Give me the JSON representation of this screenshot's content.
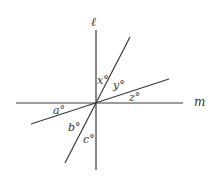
{
  "diagram": {
    "lines": [
      {
        "id": "l",
        "name": "ℓ",
        "orientation": "vertical"
      },
      {
        "id": "m",
        "name": "m",
        "orientation": "horizontal"
      },
      {
        "id": "steep",
        "name": "",
        "orientation": "steep-diagonal"
      },
      {
        "id": "shallow",
        "name": "",
        "orientation": "shallow-diagonal"
      }
    ],
    "angle_labels": {
      "x": "x°",
      "y": "y°",
      "z": "z°",
      "a": "a°",
      "b": "b°",
      "c": "c°"
    },
    "line_labels": {
      "l": "ℓ",
      "m": "m"
    }
  }
}
